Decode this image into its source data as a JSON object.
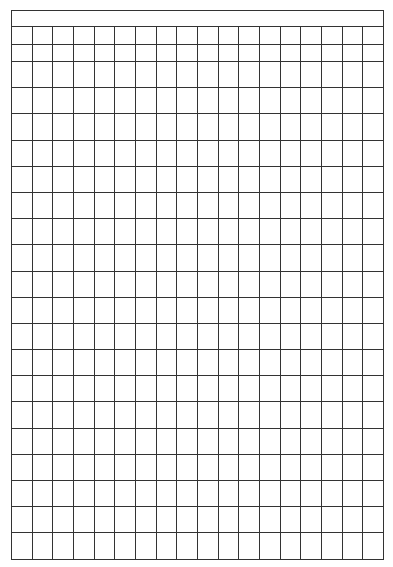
{
  "sheet": {
    "type": "blank-grid-form",
    "columns": 18,
    "header_row": {
      "merged": true,
      "text": ""
    },
    "short_rows": 2,
    "tall_rows": 19,
    "line_color": "#333333",
    "background_color": "#ffffff"
  }
}
